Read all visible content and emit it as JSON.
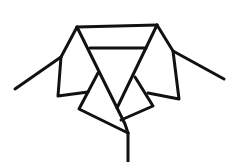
{
  "figure": {
    "stroke_color": "#111111",
    "background": "#ffffff",
    "stroke_width": 3,
    "parts": [
      {
        "name": "collar-top-band",
        "points": [
          [
            77,
            27
          ],
          [
            157,
            25
          ]
        ]
      },
      {
        "name": "collar-inner-band",
        "points": [
          [
            90,
            48
          ],
          [
            146,
            48
          ]
        ]
      },
      {
        "name": "left-shoulder-line",
        "points": [
          [
            15,
            89
          ],
          [
            61,
            57
          ],
          [
            77,
            27
          ]
        ]
      },
      {
        "name": "left-collar-flap",
        "points": [
          [
            61,
            57
          ],
          [
            58,
            96
          ],
          [
            88,
            92
          ]
        ]
      },
      {
        "name": "left-lapel-diagonal",
        "points": [
          [
            77,
            27
          ],
          [
            125,
            124
          ],
          [
            128,
            133
          ]
        ]
      },
      {
        "name": "left-lower-lapel",
        "points": [
          [
            98,
            73
          ],
          [
            79,
            109
          ],
          [
            128,
            133
          ]
        ]
      },
      {
        "name": "right-lapel-diagonal",
        "points": [
          [
            157,
            25
          ],
          [
            117,
            108
          ]
        ]
      },
      {
        "name": "right-shoulder-line",
        "points": [
          [
            157,
            25
          ],
          [
            173,
            51
          ],
          [
            224,
            79
          ]
        ]
      },
      {
        "name": "right-collar-flap",
        "points": [
          [
            173,
            51
          ],
          [
            179,
            99
          ],
          [
            148,
            93
          ]
        ]
      },
      {
        "name": "right-lower-lapel",
        "points": [
          [
            135,
            77
          ],
          [
            153,
            106
          ],
          [
            121,
            120
          ]
        ]
      },
      {
        "name": "center-placket-line",
        "points": [
          [
            128,
            133
          ],
          [
            128,
            162
          ]
        ]
      }
    ]
  }
}
